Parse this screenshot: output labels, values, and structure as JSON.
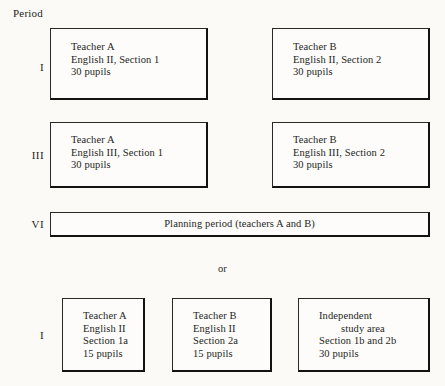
{
  "diagram": {
    "column_heading": "Period",
    "alternative_separator": "or",
    "rows": [
      {
        "label": "I",
        "boxes": [
          {
            "lines": [
              "Teacher A",
              "English II, Section 1",
              "30 pupils"
            ]
          },
          {
            "lines": [
              "Teacher B",
              "English II, Section 2",
              "30 pupils"
            ]
          }
        ]
      },
      {
        "label": "III",
        "boxes": [
          {
            "lines": [
              "Teacher A",
              "English III, Section 1",
              "30 pupils"
            ]
          },
          {
            "lines": [
              "Teacher B",
              "English III, Section 2",
              "30 pupils"
            ]
          }
        ]
      },
      {
        "label": "VI",
        "boxes": [
          {
            "lines": [
              "Planning period (teachers A and B)"
            ]
          }
        ]
      },
      {
        "label": "I",
        "boxes": [
          {
            "lines": [
              "Teacher A",
              "English II",
              "Section 1a",
              "15 pupils"
            ]
          },
          {
            "lines": [
              "Teacher B",
              "English II",
              "Section 2a",
              "15 pupils"
            ]
          },
          {
            "lines": [
              "Independent",
              "study area",
              "Section 1b and 2b",
              "30 pupils"
            ]
          }
        ]
      }
    ]
  },
  "colors": {
    "paper": "#fbfaf7",
    "ink": "#241f1c",
    "border": "#2a2724"
  }
}
